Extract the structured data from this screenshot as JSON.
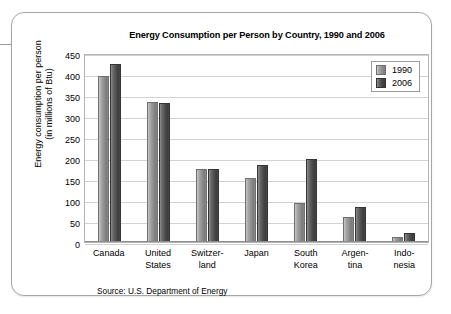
{
  "chart_data": {
    "type": "bar",
    "title": "Energy Consumption per Person by Country, 1990 and 2006",
    "xlabel": "",
    "ylabel": "Energy consumption per person (in millions of Btu)",
    "ylabel_line1": "Energy consumption per person",
    "ylabel_line2": "(in millions of Btu)",
    "categories": [
      "Canada",
      "United States",
      "Switzerland",
      "Japan",
      "South Korea",
      "Argentina",
      "Indonesia"
    ],
    "category_labels": [
      [
        "Canada",
        ""
      ],
      [
        "United",
        "States"
      ],
      [
        "Switzer-",
        "land"
      ],
      [
        "Japan",
        ""
      ],
      [
        "South",
        "Korea"
      ],
      [
        "Argen-",
        "tina"
      ],
      [
        "Indo-",
        "nesia"
      ]
    ],
    "series": [
      {
        "name": "1990",
        "color": "#8f8f8f",
        "values": [
          395,
          334,
          175,
          153,
          93,
          60,
          12
        ]
      },
      {
        "name": "2006",
        "color": "#4a4a4a",
        "values": [
          425,
          332,
          175,
          184,
          198,
          84,
          22
        ]
      }
    ],
    "ylim": [
      0,
      450
    ],
    "ytick_values": [
      450,
      400,
      350,
      300,
      250,
      200,
      150,
      100,
      50,
      0
    ],
    "ytick_labels": [
      "450",
      "400",
      "350",
      "300",
      "250",
      "200",
      "150",
      "100",
      "50",
      "0"
    ],
    "grid": true,
    "legend_position": "top-right-inside",
    "legend_entries": [
      "1990",
      "2006"
    ],
    "source": "Source: U.S. Department of Energy"
  }
}
